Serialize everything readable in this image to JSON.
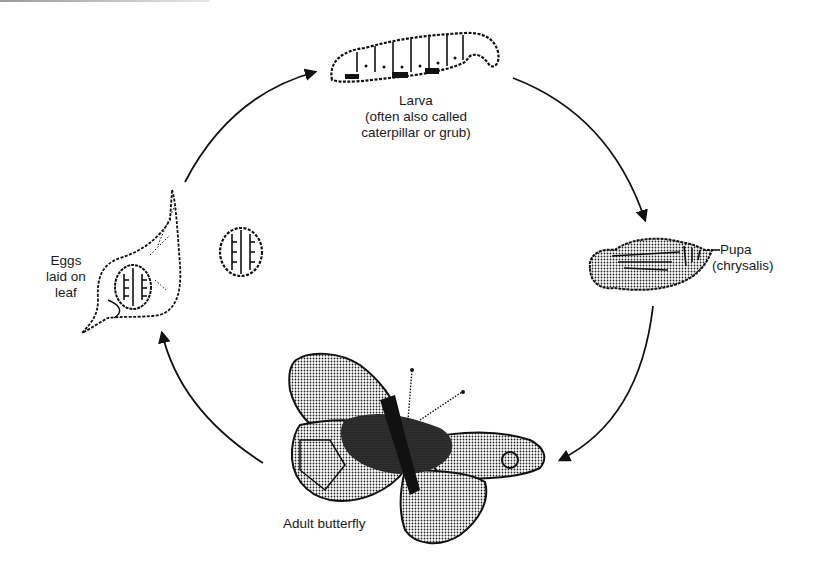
{
  "diagram": {
    "type": "life-cycle",
    "subject": "butterfly",
    "stages": [
      {
        "id": "larva",
        "lines": [
          "Larva",
          "(often also called",
          "caterpillar or grub)"
        ]
      },
      {
        "id": "pupa",
        "lines": [
          "Pupa",
          "(chrysalis)"
        ]
      },
      {
        "id": "adult",
        "lines": [
          "Adult butterfly"
        ]
      },
      {
        "id": "eggs",
        "lines": [
          "Eggs",
          "laid on",
          "leaf"
        ]
      }
    ],
    "arrows": [
      {
        "from": "eggs",
        "to": "larva"
      },
      {
        "from": "larva",
        "to": "pupa"
      },
      {
        "from": "pupa",
        "to": "adult"
      },
      {
        "from": "adult",
        "to": "eggs"
      }
    ],
    "colors": {
      "ink": "#111111",
      "background": "#ffffff"
    }
  }
}
